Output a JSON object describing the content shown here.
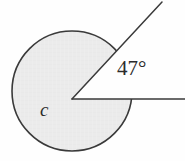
{
  "figure": {
    "background_color": "#fefefe",
    "width": 185,
    "height": 161,
    "labels": {
      "angle": "47°",
      "center": "c"
    },
    "colors": {
      "circle_fill": "#ebebeb",
      "circle_stroke": "#3a3a3a",
      "ray_stroke": "#3a3a3a",
      "text": "#2b2b2b",
      "sector_fill": "#fefefe"
    },
    "geometry": {
      "circle": {
        "center_x": 72,
        "center_y": 91,
        "radius": 60,
        "stroke_width": 1.6
      },
      "vertex": {
        "x": 72,
        "y": 99
      },
      "rays": [
        {
          "name": "horizontal-ray",
          "from_x": 72,
          "from_y": 99,
          "to_x": 185,
          "to_y": 99,
          "angle_degrees": 0
        },
        {
          "name": "upper-ray",
          "from_x": 72,
          "from_y": 99,
          "to_x": 162,
          "to_y": 2,
          "angle_degrees": 47
        }
      ],
      "sector": {
        "name": "cut-out-wedge",
        "start_angle_degrees": 0,
        "end_angle_degrees": 47
      }
    }
  },
  "chart_data": {
    "type": "diagram",
    "shape": "circle-with-angle",
    "annotations": [
      {
        "name": "angle-measure",
        "text": "47°",
        "value": 47,
        "unit": "degrees"
      },
      {
        "name": "center-point-label",
        "text": "c"
      }
    ],
    "elements": [
      {
        "name": "circle",
        "center": [
          72,
          91
        ],
        "radius": 60,
        "fill": "#ebebeb",
        "stroke": "#3a3a3a"
      },
      {
        "name": "wedge-cutout",
        "vertex": [
          72,
          99
        ],
        "from_angle": 0,
        "to_angle": 47,
        "fill": "#fefefe"
      },
      {
        "name": "ray-horizontal",
        "from": [
          72,
          99
        ],
        "to": [
          185,
          99
        ]
      },
      {
        "name": "ray-upper",
        "from": [
          72,
          99
        ],
        "to": [
          162,
          2
        ]
      }
    ]
  }
}
